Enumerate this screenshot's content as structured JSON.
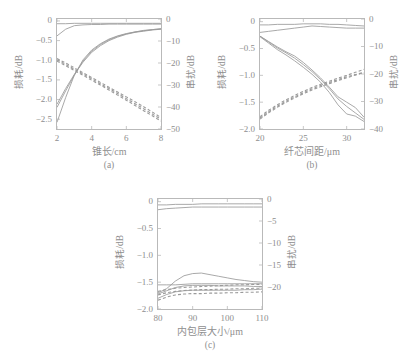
{
  "figure": {
    "width": 406,
    "height": 359,
    "background": "#ffffff",
    "axis_color": "#b9b9b9",
    "text_color": "#8e8e8e",
    "solid_curve_color": "#9a9a9a",
    "dashed_curve_color": "#9a9a9a"
  },
  "chart_data": [
    {
      "type": "line",
      "panel": "a",
      "caption": "(a)",
      "title": "",
      "xlabel": "锥长/cm",
      "ylabel": "损耗/dB",
      "y2label": "串扰/dB",
      "xlim": [
        2,
        8
      ],
      "ylim": [
        -2.75,
        0.05
      ],
      "y2lim": [
        -50,
        0
      ],
      "grid": false,
      "legend": "none",
      "xticks": [
        2,
        4,
        6,
        8
      ],
      "xticklabels": [
        "2",
        "4",
        "6",
        "8"
      ],
      "yticks": [
        0,
        -0.5,
        -1.0,
        -1.5,
        -2.0,
        -2.5
      ],
      "yticklabels": [
        "0",
        "−0.5",
        "−1.0",
        "−1.5",
        "−2.0",
        "−2.5"
      ],
      "y2ticks": [
        0,
        -10,
        -20,
        -30,
        -40,
        -50
      ],
      "y2ticklabels": [
        "0",
        "−10",
        "−20",
        "−30",
        "−40",
        "−50"
      ],
      "x": [
        2,
        2.5,
        3,
        3.5,
        4,
        4.5,
        5,
        5.5,
        6,
        6.5,
        7,
        7.5,
        8
      ],
      "series": [
        {
          "name": "loss-flat-1",
          "style": "solid",
          "axis": "left",
          "values": [
            -0.07,
            -0.07,
            -0.06,
            -0.06,
            -0.06,
            -0.06,
            -0.06,
            -0.06,
            -0.06,
            -0.06,
            -0.06,
            -0.06,
            -0.06
          ]
        },
        {
          "name": "loss-flat-2",
          "style": "solid",
          "axis": "left",
          "values": [
            -0.38,
            -0.21,
            -0.12,
            -0.1,
            -0.09,
            -0.09,
            -0.08,
            -0.08,
            -0.08,
            -0.08,
            -0.08,
            -0.08,
            -0.08
          ]
        },
        {
          "name": "loss-rise-1",
          "style": "solid",
          "axis": "left",
          "values": [
            -2.12,
            -1.72,
            -1.36,
            -1.05,
            -0.8,
            -0.63,
            -0.5,
            -0.41,
            -0.34,
            -0.29,
            -0.26,
            -0.23,
            -0.21
          ]
        },
        {
          "name": "loss-rise-2",
          "style": "solid",
          "axis": "left",
          "values": [
            -2.2,
            -1.78,
            -1.38,
            -1.02,
            -0.77,
            -0.6,
            -0.48,
            -0.39,
            -0.33,
            -0.28,
            -0.25,
            -0.22,
            -0.2
          ]
        },
        {
          "name": "loss-rise-3",
          "style": "solid",
          "axis": "left",
          "values": [
            -2.58,
            -1.95,
            -1.38,
            -0.99,
            -0.74,
            -0.58,
            -0.46,
            -0.38,
            -0.32,
            -0.28,
            -0.24,
            -0.22,
            -0.2
          ]
        },
        {
          "name": "crosstalk-1",
          "style": "dashed",
          "axis": "right",
          "values": [
            -18.0,
            -20.0,
            -22.2,
            -24.4,
            -26.6,
            -28.8,
            -31.0,
            -33.2,
            -35.4,
            -37.6,
            -39.9,
            -42.3,
            -44.8
          ]
        },
        {
          "name": "crosstalk-2",
          "style": "dashed",
          "axis": "right",
          "values": [
            -18.6,
            -20.6,
            -22.8,
            -25.0,
            -27.2,
            -29.4,
            -31.6,
            -33.9,
            -36.2,
            -38.5,
            -40.8,
            -43.2,
            -45.6
          ]
        },
        {
          "name": "crosstalk-3",
          "style": "dashed",
          "axis": "right",
          "values": [
            -19.2,
            -21.2,
            -23.4,
            -25.6,
            -27.8,
            -30.0,
            -32.3,
            -34.6,
            -36.9,
            -39.3,
            -41.7,
            -44.0,
            -46.4
          ]
        }
      ]
    },
    {
      "type": "line",
      "panel": "b",
      "caption": "(b)",
      "title": "",
      "xlabel": "纤芯间距/μm",
      "ylabel": "损耗/dB",
      "y2label": "串扰/dB",
      "xlim": [
        20,
        32
      ],
      "ylim": [
        -2.0,
        0.05
      ],
      "y2lim": [
        -40,
        0
      ],
      "grid": false,
      "legend": "none",
      "xticks": [
        20,
        25,
        30
      ],
      "xticklabels": [
        "20",
        "25",
        "30"
      ],
      "yticks": [
        0,
        -0.5,
        -1.0,
        -1.5,
        -2.0
      ],
      "yticklabels": [
        "0",
        "−0.5",
        "−1.0",
        "−1.5",
        "−2.0"
      ],
      "y2ticks": [
        0,
        -10,
        -20,
        -30,
        -40
      ],
      "y2ticklabels": [
        "0",
        "−10",
        "−20",
        "−30",
        "−40"
      ],
      "x": [
        20,
        21,
        22,
        23,
        24,
        25,
        26,
        27,
        28,
        29,
        30,
        31,
        32
      ],
      "series": [
        {
          "name": "loss-flat-1",
          "style": "solid",
          "axis": "left",
          "values": [
            -0.06,
            -0.06,
            -0.05,
            -0.05,
            -0.05,
            -0.04,
            -0.04,
            -0.04,
            -0.05,
            -0.05,
            -0.06,
            -0.07,
            -0.08
          ]
        },
        {
          "name": "loss-flat-2",
          "style": "solid",
          "axis": "left",
          "values": [
            -0.2,
            -0.18,
            -0.16,
            -0.14,
            -0.12,
            -0.1,
            -0.08,
            -0.09,
            -0.1,
            -0.11,
            -0.12,
            -0.12,
            -0.12
          ]
        },
        {
          "name": "loss-fall-1",
          "style": "solid",
          "axis": "left",
          "values": [
            -0.27,
            -0.37,
            -0.47,
            -0.56,
            -0.64,
            -0.76,
            -0.9,
            -1.05,
            -1.22,
            -1.4,
            -1.5,
            -1.6,
            -1.78
          ]
        },
        {
          "name": "loss-fall-2",
          "style": "solid",
          "axis": "left",
          "values": [
            -0.27,
            -0.38,
            -0.49,
            -0.58,
            -0.68,
            -0.8,
            -0.93,
            -1.08,
            -1.25,
            -1.44,
            -1.58,
            -1.7,
            -1.82
          ]
        },
        {
          "name": "loss-fall-3",
          "style": "solid",
          "axis": "left",
          "values": [
            -0.28,
            -0.4,
            -0.52,
            -0.62,
            -0.73,
            -0.85,
            -0.98,
            -1.13,
            -1.32,
            -1.55,
            -1.72,
            -1.76,
            -1.86
          ]
        },
        {
          "name": "crosstalk-1",
          "style": "dashed",
          "axis": "right",
          "values": [
            -35.5,
            -33.2,
            -31.2,
            -29.4,
            -27.8,
            -26.3,
            -24.9,
            -23.7,
            -22.6,
            -21.5,
            -20.5,
            -19.4,
            -18.3
          ]
        },
        {
          "name": "crosstalk-2",
          "style": "dashed",
          "axis": "right",
          "values": [
            -36.0,
            -33.7,
            -31.7,
            -29.9,
            -28.3,
            -26.8,
            -25.4,
            -24.2,
            -23.1,
            -22.0,
            -21.0,
            -20.2,
            -19.4
          ]
        },
        {
          "name": "crosstalk-3",
          "style": "dashed",
          "axis": "right",
          "values": [
            -36.4,
            -34.1,
            -32.1,
            -30.3,
            -28.7,
            -27.2,
            -25.8,
            -24.6,
            -23.5,
            -22.4,
            -21.4,
            -20.4,
            -19.5
          ]
        }
      ]
    },
    {
      "type": "line",
      "panel": "c",
      "caption": "(c)",
      "title": "",
      "xlabel": "内包层大小/μm",
      "ylabel": "损耗/dB",
      "y2label": "串扰/dB",
      "xlim": [
        80,
        110
      ],
      "ylim": [
        -2.0,
        0.05
      ],
      "y2lim": [
        -25,
        0
      ],
      "grid": false,
      "legend": "none",
      "xticks": [
        80,
        90,
        100,
        110
      ],
      "xticklabels": [
        "80",
        "90",
        "100",
        "110"
      ],
      "yticks": [
        0,
        -0.5,
        -1.0,
        -1.5,
        -2.0
      ],
      "yticklabels": [
        "0",
        "−0.5",
        "−1.0",
        "−1.5",
        "−2.0"
      ],
      "y2ticks": [
        0,
        -5,
        -10,
        -15,
        -20
      ],
      "y2ticklabels": [
        "0",
        "−5",
        "−10",
        "−15",
        "−20"
      ],
      "x": [
        80,
        82.5,
        85,
        87.5,
        90,
        92.5,
        95,
        97.5,
        100,
        102.5,
        105,
        107.5,
        110
      ],
      "series": [
        {
          "name": "loss-flat-1",
          "style": "solid",
          "axis": "left",
          "values": [
            -0.06,
            -0.06,
            -0.05,
            -0.05,
            -0.05,
            -0.04,
            -0.04,
            -0.04,
            -0.04,
            -0.04,
            -0.04,
            -0.04,
            -0.04
          ]
        },
        {
          "name": "loss-flat-2",
          "style": "solid",
          "axis": "left",
          "values": [
            -0.15,
            -0.13,
            -0.12,
            -0.11,
            -0.1,
            -0.1,
            -0.1,
            -0.1,
            -0.1,
            -0.1,
            -0.1,
            -0.1,
            -0.1
          ]
        },
        {
          "name": "loss-mid-1",
          "style": "solid",
          "axis": "left",
          "values": [
            -1.7,
            -1.62,
            -1.48,
            -1.38,
            -1.34,
            -1.33,
            -1.36,
            -1.39,
            -1.42,
            -1.45,
            -1.47,
            -1.49,
            -1.5
          ]
        },
        {
          "name": "loss-mid-2",
          "style": "solid",
          "axis": "left",
          "values": [
            -1.55,
            -1.55,
            -1.55,
            -1.54,
            -1.53,
            -1.53,
            -1.53,
            -1.53,
            -1.53,
            -1.53,
            -1.53,
            -1.53,
            -1.53
          ]
        },
        {
          "name": "loss-mid-3",
          "style": "solid",
          "axis": "left",
          "values": [
            -1.72,
            -1.66,
            -1.6,
            -1.57,
            -1.56,
            -1.56,
            -1.56,
            -1.57,
            -1.57,
            -1.57,
            -1.57,
            -1.58,
            -1.58
          ]
        },
        {
          "name": "loss-mid-4",
          "style": "solid",
          "axis": "left",
          "values": [
            -1.8,
            -1.73,
            -1.68,
            -1.66,
            -1.65,
            -1.65,
            -1.65,
            -1.65,
            -1.65,
            -1.65,
            -1.64,
            -1.64,
            -1.63
          ]
        },
        {
          "name": "crosstalk-1",
          "style": "dashed",
          "axis": "right",
          "values": [
            -21.0,
            -20.6,
            -20.3,
            -20.1,
            -20.0,
            -19.9,
            -19.8,
            -19.7,
            -19.6,
            -19.5,
            -19.5,
            -19.4,
            -19.4
          ]
        },
        {
          "name": "crosstalk-2",
          "style": "dashed",
          "axis": "right",
          "values": [
            -21.8,
            -21.3,
            -21.0,
            -20.8,
            -20.7,
            -20.6,
            -20.6,
            -20.5,
            -20.5,
            -20.4,
            -20.4,
            -20.3,
            -20.3
          ]
        },
        {
          "name": "crosstalk-3",
          "style": "dashed",
          "axis": "right",
          "values": [
            -23.0,
            -22.3,
            -21.8,
            -21.6,
            -21.5,
            -21.5,
            -21.4,
            -21.4,
            -21.3,
            -21.3,
            -21.2,
            -21.2,
            -21.1
          ]
        }
      ]
    }
  ]
}
